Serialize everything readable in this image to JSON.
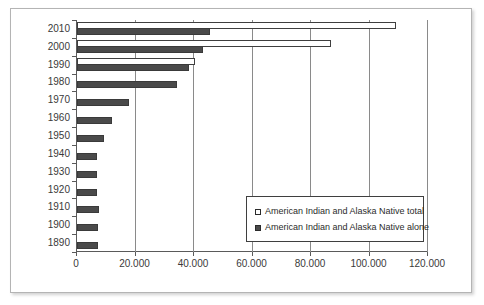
{
  "chart_data": {
    "type": "bar",
    "orientation": "horizontal",
    "title": "",
    "subtitle": "",
    "xlabel": "",
    "ylabel": "",
    "grid": true,
    "legend_position": "inside-bottom-right",
    "xlim": [
      0,
      120000
    ],
    "xticks": [
      0,
      20000,
      40000,
      60000,
      80000,
      100000,
      120000
    ],
    "xtick_labels": [
      "0",
      "20.000",
      "40.000",
      "60.000",
      "80.000",
      "100.000",
      "120.000"
    ],
    "categories": [
      "2010",
      "2000",
      "1990",
      "1980",
      "1970",
      "1960",
      "1950",
      "1940",
      "1930",
      "1920",
      "1910",
      "1900",
      "1890"
    ],
    "series": [
      {
        "name": "American Indian and Alaska Native total",
        "swatch": "total",
        "values": [
          109000,
          86800,
          40300,
          0,
          0,
          0,
          0,
          0,
          0,
          0,
          0,
          0,
          0
        ]
      },
      {
        "name": "American Indian and Alaska Native alone",
        "swatch": "alone",
        "values": [
          45500,
          43000,
          38300,
          34200,
          17800,
          12000,
          9200,
          7000,
          7000,
          6800,
          7400,
          7100,
          7300
        ]
      }
    ]
  },
  "legend": {
    "entries": [
      {
        "label": "American Indian and Alaska Native total",
        "swatch": "total"
      },
      {
        "label": "American Indian and Alaska Native alone",
        "swatch": "alone"
      }
    ]
  }
}
